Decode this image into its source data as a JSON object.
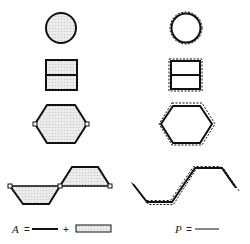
{
  "diagram": {
    "left_column": {
      "meaning": "area",
      "shapes": [
        "circle",
        "split-square",
        "hexagon",
        "trapezoid-wave"
      ]
    },
    "right_column": {
      "meaning": "perimeter",
      "shapes": [
        "circle-outline",
        "split-square-outline",
        "hexagon-outline",
        "polyline-wave-outline"
      ]
    },
    "legend": {
      "area_symbol": "A",
      "area_equals": "=",
      "area_plus": "+",
      "perimeter_symbol": "P",
      "perimeter_equals": "="
    },
    "colors": {
      "stroke": "#111111",
      "fill": "#e4e4e4",
      "background": "#ffffff"
    }
  }
}
